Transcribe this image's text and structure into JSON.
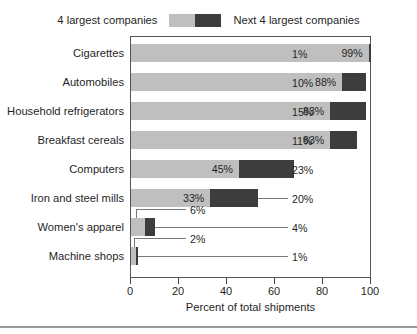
{
  "legend": {
    "left_label": "4 largest companies",
    "right_label": "Next 4 largest companies",
    "light_color": "#bfbfbf",
    "dark_color": "#3d3d3d"
  },
  "axis": {
    "x_title": "Percent of total shipments",
    "x_ticks": [
      "0",
      "20",
      "40",
      "60",
      "80",
      "100"
    ]
  },
  "chart_data": {
    "type": "bar",
    "orientation": "horizontal",
    "stacked": true,
    "title": "",
    "subtitle": "",
    "xlabel": "Percent of total shipments",
    "ylabel": "",
    "xlim": [
      0,
      100
    ],
    "xticks": [
      0,
      20,
      40,
      60,
      80,
      100
    ],
    "grid": false,
    "legend_position": "top-center",
    "categories": [
      "Cigarettes",
      "Automobiles",
      "Household refrigerators",
      "Breakfast cereals",
      "Computers",
      "Iron and steel mills",
      "Women's apparel",
      "Machine shops"
    ],
    "series": [
      {
        "name": "4 largest companies",
        "color": "#bfbfbf",
        "values": [
          99,
          88,
          83,
          83,
          45,
          33,
          6,
          2
        ],
        "labels": [
          "99%",
          "88%",
          "83%",
          "83%",
          "45%",
          "33%",
          "6%",
          "2%"
        ]
      },
      {
        "name": "Next 4 largest companies",
        "color": "#3d3d3d",
        "values": [
          1,
          10,
          15,
          11,
          23,
          20,
          4,
          1
        ],
        "labels": [
          "1%",
          "10%",
          "15%",
          "11%",
          "23%",
          "20%",
          "4%",
          "1%"
        ]
      }
    ]
  },
  "rows": [
    {
      "category": "Cigarettes",
      "light": 99,
      "dark": 1,
      "light_label": "99%",
      "dark_label": "1%",
      "light_label_inside": true,
      "dark_label_outside": true
    },
    {
      "category": "Automobiles",
      "light": 88,
      "dark": 10,
      "light_label": "88%",
      "dark_label": "10%",
      "light_label_inside": true,
      "dark_label_outside": true
    },
    {
      "category": "Household refrigerators",
      "light": 83,
      "dark": 15,
      "light_label": "83%",
      "dark_label": "15%",
      "light_label_inside": true,
      "dark_label_outside": true
    },
    {
      "category": "Breakfast cereals",
      "light": 83,
      "dark": 11,
      "light_label": "83%",
      "dark_label": "11%",
      "light_label_inside": true,
      "dark_label_outside": true
    },
    {
      "category": "Computers",
      "light": 45,
      "dark": 23,
      "light_label": "45%",
      "dark_label": "23%",
      "light_label_inside": true,
      "dark_label_outside": true
    },
    {
      "category": "Iron and steel mills",
      "light": 33,
      "dark": 20,
      "light_label": "33%",
      "dark_label": "20%",
      "light_label_inside": true,
      "dark_label_outside": true
    },
    {
      "category": "Women's apparel",
      "light": 6,
      "dark": 4,
      "light_label": "6%",
      "dark_label": "4%",
      "light_label_inside": false,
      "dark_label_outside": true
    },
    {
      "category": "Machine shops",
      "light": 2,
      "dark": 1,
      "light_label": "2%",
      "dark_label": "1%",
      "light_label_inside": false,
      "dark_label_outside": true
    }
  ]
}
